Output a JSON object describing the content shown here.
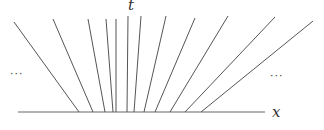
{
  "diagram": {
    "type": "characteristic-lines-fan",
    "axis_labels": {
      "x": "x",
      "t": "t"
    },
    "ellipsis_left": "···",
    "ellipsis_right": "···",
    "line_color": "#555555",
    "axis_color": "#666666",
    "x_axis": {
      "x1": 18,
      "y": 112,
      "x2": 265
    },
    "lines": [
      {
        "top": [
          14,
          22
        ],
        "bottom": [
          79,
          112
        ]
      },
      {
        "top": [
          53,
          19
        ],
        "bottom": [
          93,
          112
        ]
      },
      {
        "top": [
          88,
          19
        ],
        "bottom": [
          105,
          112
        ]
      },
      {
        "top": [
          106,
          19
        ],
        "bottom": [
          113,
          112
        ]
      },
      {
        "top": [
          116,
          19
        ],
        "bottom": [
          116,
          112
        ]
      },
      {
        "top": [
          128,
          16
        ],
        "bottom": [
          127,
          112
        ]
      },
      {
        "top": [
          141,
          16
        ],
        "bottom": [
          134,
          112
        ]
      },
      {
        "top": [
          166,
          16
        ],
        "bottom": [
          144,
          112
        ]
      },
      {
        "top": [
          195,
          18
        ],
        "bottom": [
          155,
          112
        ]
      },
      {
        "top": [
          228,
          16
        ],
        "bottom": [
          170,
          112
        ]
      },
      {
        "top": [
          275,
          17
        ],
        "bottom": [
          185,
          112
        ]
      },
      {
        "top": [
          313,
          21
        ],
        "bottom": [
          201,
          112
        ]
      }
    ]
  }
}
